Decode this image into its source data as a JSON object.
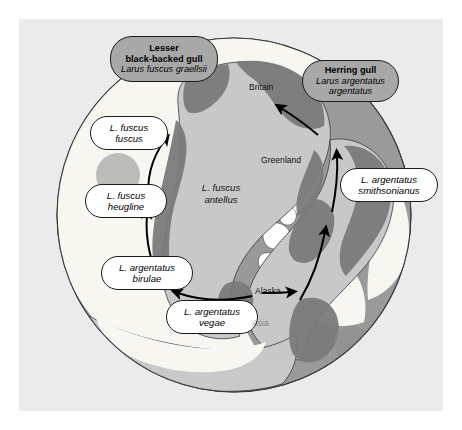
{
  "figure": {
    "kind": "ring-species-distribution-map",
    "projection": "north-polar",
    "background_color": "#ffffff",
    "panel_color": "#ebebeb"
  },
  "map": {
    "ocean_color": "#9a9a9a",
    "land_color": "#c9c9c9",
    "ice_color": "#f7f6f1",
    "range_color": "#7b7b7b",
    "outline_color": "#3a3a3a",
    "arrow_color": "#000000"
  },
  "species_callouts": [
    {
      "id": "lesser-black-backed-gull",
      "common_name": "Lesser\nblack-backed gull",
      "common_name_line1": "Lesser",
      "common_name_line2": "black-backed gull",
      "scientific_name": "Larus fuscus graellsii",
      "fill": "#a8a8a8"
    },
    {
      "id": "herring-gull",
      "common_name": "Herring gull",
      "common_name_line1": "Herring gull",
      "common_name_line2": "",
      "scientific_name_line1": "Larus argentatus",
      "scientific_name_line2": "argentatus",
      "fill": "#a8a8a8"
    }
  ],
  "subspecies_callouts": [
    {
      "id": "fuscus-fuscus",
      "line1": "L. fuscus",
      "line2": "fuscus"
    },
    {
      "id": "fuscus-heugline",
      "line1": "L. fuscus",
      "line2": "heugline"
    },
    {
      "id": "argentatus-birulae",
      "line1": "L. argentatus",
      "line2": "birulae"
    },
    {
      "id": "argentatus-vegae",
      "line1": "L. argentatus",
      "line2": "vegae"
    },
    {
      "id": "argentatus-smithsonianus",
      "line1": "L. argentatus",
      "line2": "smithsonianus"
    }
  ],
  "map_text_labels": [
    {
      "id": "fuscus-antellus",
      "line1": "L. fuscus",
      "line2": "antellus"
    }
  ],
  "geographic_labels": [
    {
      "id": "britain",
      "text": "Britain"
    },
    {
      "id": "greenland",
      "text": "Greenland"
    },
    {
      "id": "alaska",
      "text": "Alaska"
    },
    {
      "id": "asia",
      "text": "Asia"
    }
  ],
  "gene_flow_arrows": {
    "count": 6,
    "description": "black curved arrows forming a ring around the Arctic"
  }
}
